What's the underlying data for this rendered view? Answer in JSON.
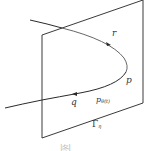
{
  "figure": {
    "plane_label": "Γ",
    "plane_label_sub": "η",
    "labels": {
      "r": "r",
      "p": "p",
      "q": "q",
      "p_theta": "p",
      "p_theta_sub": "θ(t)"
    },
    "colors": {
      "plane_stroke": "#3a3a3a",
      "curve_stroke": "#2a2a2a",
      "text": "#333333"
    },
    "caption": "图 …"
  }
}
